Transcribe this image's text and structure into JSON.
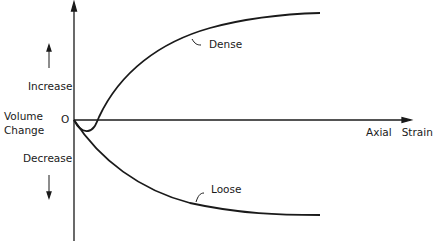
{
  "figure": {
    "y_axis": {
      "label_line1": "Volume",
      "label_line2": "Change",
      "origin": "O",
      "up_label": "Increase",
      "down_label": "Decrease"
    },
    "x_axis": {
      "label": "Axial   Strain"
    },
    "curves": [
      {
        "name": "Dense",
        "label": "Dense"
      },
      {
        "name": "Loose",
        "label": "Loose"
      }
    ],
    "colors": {
      "ink": "#1a1a1a",
      "background": "#ffffff"
    }
  }
}
